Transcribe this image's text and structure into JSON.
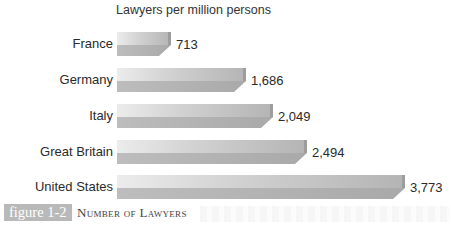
{
  "chart_data": {
    "type": "bar",
    "orientation": "horizontal",
    "title": "Lawyers per million persons",
    "categories": [
      "France",
      "Germany",
      "Italy",
      "Great Britain",
      "United States"
    ],
    "values": [
      713,
      1686,
      2049,
      2494,
      3773
    ],
    "value_labels": [
      "713",
      "1,686",
      "2,049",
      "2,494",
      "3,773"
    ],
    "xlabel": "",
    "ylabel": "",
    "xlim": [
      0,
      3773
    ],
    "grid": false,
    "legend": "none",
    "data_labels": "end of bar"
  },
  "figure": {
    "badge": "figure 1-2",
    "caption": "Number of Lawyers"
  },
  "colors": {
    "bar_light": "#ececec",
    "bar_dark": "#a9a9a9",
    "badge_bg": "#b9b9b9",
    "text": "#2a2a2a"
  }
}
